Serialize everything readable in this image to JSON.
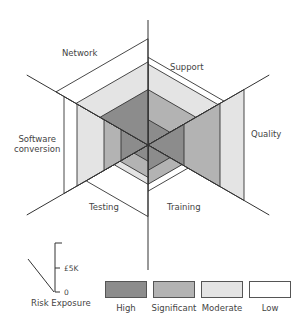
{
  "chart_data": {
    "type": "radar-hexagon-risk",
    "title": "",
    "center": [
      148,
      145
    ],
    "axis_length": 140,
    "axes_deg": [
      90,
      30,
      -30,
      -90,
      210,
      150
    ],
    "sectors": [
      {
        "name": "Support",
        "bisector_deg": 60,
        "bands": [
          {
            "level": "High",
            "to": 22
          },
          {
            "level": "Significant",
            "to": 48
          },
          {
            "level": "Moderate",
            "to": 70
          },
          {
            "level": "Low",
            "to": 76
          }
        ],
        "risk_level": "Moderate"
      },
      {
        "name": "Quality",
        "bisector_deg": 0,
        "bands": [
          {
            "level": "High",
            "to": 36
          },
          {
            "level": "Significant",
            "to": 72
          },
          {
            "level": "Moderate",
            "to": 96
          }
        ],
        "risk_level": "Moderate"
      },
      {
        "name": "Training",
        "bisector_deg": -60,
        "bands": [
          {
            "level": "High",
            "to": 22
          },
          {
            "level": "Significant",
            "to": 34
          },
          {
            "level": "Low",
            "to": 40
          }
        ],
        "risk_level": "Significant"
      },
      {
        "name": "Testing",
        "bisector_deg": 240,
        "bands": [
          {
            "level": "High",
            "to": 14
          },
          {
            "level": "Significant",
            "to": 28
          },
          {
            "level": "Moderate",
            "to": 34
          },
          {
            "level": "Low",
            "to": 62
          }
        ],
        "risk_level": "Low"
      },
      {
        "name": "Software conversion",
        "bisector_deg": 180,
        "bands": [
          {
            "level": "High",
            "to": 27
          },
          {
            "level": "Significant",
            "to": 44
          },
          {
            "level": "Moderate",
            "to": 71
          },
          {
            "level": "Low",
            "to": 84
          }
        ],
        "risk_level": "Low"
      },
      {
        "name": "Network",
        "bisector_deg": 120,
        "bands": [
          {
            "level": "High",
            "to": 48
          },
          {
            "level": "Moderate",
            "to": 72
          },
          {
            "level": "Low",
            "to": 92
          }
        ],
        "risk_level": "Low"
      }
    ],
    "legend": [
      {
        "label": "High",
        "color": "#8c8c8c"
      },
      {
        "label": "Significant",
        "color": "#b3b3b3"
      },
      {
        "label": "Moderate",
        "color": "#e4e4e4"
      },
      {
        "label": "Low",
        "color": "#ffffff"
      }
    ],
    "scale": {
      "label": "Risk Exposure",
      "ticks": [
        "0",
        "£5K"
      ]
    }
  },
  "labels": {
    "network": "Network",
    "support": "Support",
    "software_1": "Software",
    "software_2": "conversion",
    "quality": "Quality",
    "testing": "Testing",
    "training": "Training",
    "risk_exposure": "Risk Exposure",
    "tick_0": "0",
    "tick_5k": "£5K",
    "legend_high": "High",
    "legend_significant": "Significant",
    "legend_moderate": "Moderate",
    "legend_low": "Low"
  }
}
